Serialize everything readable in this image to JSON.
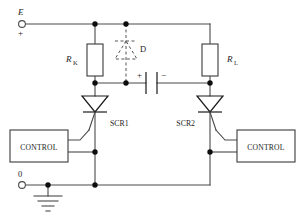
{
  "diagram": {
    "terminals": [
      {
        "id": "supply",
        "label": "E",
        "polarity": "+",
        "x": 20,
        "y": 18
      },
      {
        "id": "ground",
        "label": "0",
        "polarity": "",
        "x": 20,
        "y": 185
      }
    ],
    "components": [
      {
        "id": "rk",
        "type": "resistor",
        "label": "R",
        "subscript": "K"
      },
      {
        "id": "rl",
        "type": "resistor",
        "label": "R",
        "subscript": "L"
      },
      {
        "id": "d",
        "type": "diode",
        "label": "D",
        "style": "dashed-optional"
      },
      {
        "id": "c",
        "type": "capacitor",
        "label": "",
        "plus": "+",
        "minus": "−"
      },
      {
        "id": "scr1",
        "type": "thyristor",
        "label": "SCR1"
      },
      {
        "id": "scr2",
        "type": "thyristor",
        "label": "SCR2"
      },
      {
        "id": "ctrl1",
        "type": "block",
        "label": "CONTROL"
      },
      {
        "id": "ctrl2",
        "type": "block",
        "label": "CONTROL"
      }
    ],
    "ground_symbol": "earth-ground",
    "colors": {
      "wire": "#4a4a4a",
      "node": "#0d0d0d",
      "outline": "#3a3a3a",
      "dashed": "#555555",
      "text": "#1c1c1c",
      "background": "#ffffff"
    }
  }
}
